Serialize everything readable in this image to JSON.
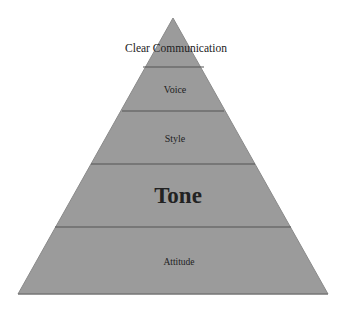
{
  "diagram": {
    "type": "pyramid",
    "colors": {
      "fill": "#9b9b9b",
      "divider": "#555555",
      "edge": "#7a7a7a",
      "text": "#222222",
      "background": "#ffffff"
    },
    "levels": [
      {
        "label": "Clear Communication",
        "position": "apex"
      },
      {
        "label": "Voice"
      },
      {
        "label": "Style"
      },
      {
        "label": "Tone",
        "emphasis": "bold-large"
      },
      {
        "label": "Attitude",
        "position": "base"
      }
    ]
  }
}
